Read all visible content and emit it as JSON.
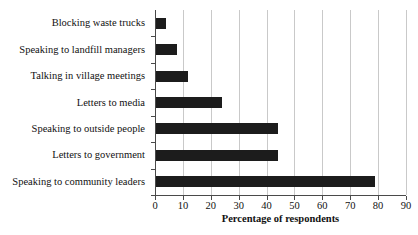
{
  "chart_data": {
    "type": "bar",
    "orientation": "horizontal",
    "title": "",
    "xlabel": "Percentage of respondents",
    "ylabel": "",
    "xlim": [
      0,
      90
    ],
    "xticks": [
      0,
      10,
      20,
      30,
      40,
      50,
      60,
      70,
      80,
      90
    ],
    "grid": "vertical",
    "legend": "none",
    "bar_color": "#1c1c1c",
    "gridline_color": "#c9c9c9",
    "axis_color": "#4a4a4a",
    "categories": [
      "Blocking waste trucks",
      "Speaking to landfill managers",
      "Talking in village meetings",
      "Letters to media",
      "Speaking to outside people",
      "Letters to government",
      "Speaking to community leaders"
    ],
    "values": [
      4,
      8,
      12,
      24,
      44,
      44,
      79
    ],
    "series": [
      {
        "name": "Percentage of respondents",
        "values": [
          4,
          8,
          12,
          24,
          44,
          44,
          79
        ]
      }
    ]
  }
}
